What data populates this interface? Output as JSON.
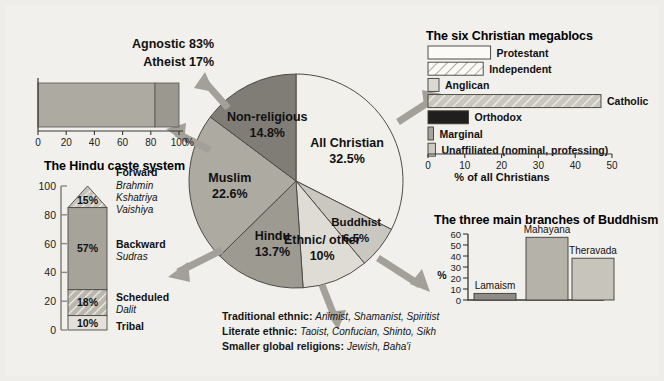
{
  "background_color": "#f1f0ec",
  "chart_data": [
    {
      "type": "pie",
      "name": "world-religions-pie",
      "title": "",
      "categories": [
        "All Christian",
        "Buddhist",
        "Ethnic/other",
        "Hindu",
        "Muslim",
        "Non-religious"
      ],
      "values": [
        32.5,
        6.5,
        10,
        13.7,
        22.6,
        14.8
      ],
      "labels": [
        {
          "name": "All Christian",
          "value": "32.5%"
        },
        {
          "name": "Buddhist",
          "value": "6.5%"
        },
        {
          "name": "Ethnic/ other",
          "value": "10%"
        },
        {
          "name": "Hindu",
          "value": "13.7%"
        },
        {
          "name": "Muslim",
          "value": "22.6%"
        },
        {
          "name": "Non-religious",
          "value": "14.8%"
        }
      ],
      "colors": [
        "#f2f0ea",
        "#c9c7bf",
        "#dedcd4",
        "#9d9a92",
        "#adaaa2",
        "#807d77"
      ],
      "start_angle_deg": 0,
      "direction": "clockwise"
    },
    {
      "type": "bar",
      "name": "agnostic-atheist-bar",
      "orientation": "horizontal",
      "stacked": true,
      "categories": [
        "Agnostic",
        "Atheist"
      ],
      "values": [
        83,
        17
      ],
      "axis_ticks": [
        "0",
        "20",
        "40",
        "60",
        "80",
        "100"
      ],
      "axis_unit": "%",
      "xlim": [
        0,
        100
      ],
      "colors": [
        "#adaaa2",
        "#9b9890"
      ],
      "annotations": [
        "Agnostic 83%",
        "Atheist 17%"
      ]
    },
    {
      "type": "bar",
      "name": "hindu-caste-bar",
      "orientation": "vertical",
      "stacked": true,
      "title": "The Hindu caste system",
      "ylim": [
        0,
        100
      ],
      "axis_ticks": [
        "0",
        "20",
        "40",
        "60",
        "80",
        "100"
      ],
      "segments": [
        {
          "label": "Tribal",
          "sub": "",
          "value": 10,
          "display": "10%",
          "fill": "#e3e1da",
          "pattern": "solid"
        },
        {
          "label": "Scheduled",
          "sub": "Dalit",
          "value": 18,
          "display": "18%",
          "fill": "#c3c0b8",
          "pattern": "hatch"
        },
        {
          "label": "Backward",
          "sub": "Sudras",
          "value": 57,
          "display": "57%",
          "fill": "#a6a39b",
          "pattern": "solid"
        },
        {
          "label": "Forward",
          "sub": "Brahmin Kshatriya Vaishiya",
          "value": 15,
          "display": "15%",
          "fill": "#b0ada5",
          "pattern": "hatch"
        }
      ],
      "forward_sub_lines": [
        "Brahmin",
        "Kshatriya",
        "Vaishiya"
      ]
    },
    {
      "type": "bar",
      "name": "christian-megablocs-bar",
      "orientation": "horizontal",
      "title": "The six Christian megablocs",
      "xlabel": "% of all Christians",
      "xlim": [
        0,
        50
      ],
      "axis_ticks": [
        "0",
        "10",
        "20",
        "30",
        "40",
        "50"
      ],
      "categories": [
        "Protestant",
        "Independent",
        "Anglican",
        "Catholic",
        "Orthodox",
        "Marginal",
        "Unaffiliated (nominal, professing)"
      ],
      "values": [
        17,
        15,
        3,
        47,
        11,
        1.5,
        2
      ],
      "fills": [
        "#fbfaf6",
        "#f6f4ee",
        "#dbd9d2",
        "#b9b6ae",
        "#201f1d",
        "#a7a49c",
        "#cdcac2"
      ],
      "patterns": [
        "solid",
        "hatch",
        "solid",
        "hatch",
        "solid",
        "solid",
        "solid"
      ]
    },
    {
      "type": "bar",
      "name": "buddhism-branches-bar",
      "orientation": "vertical",
      "title": "The three main branches of Buddhism",
      "ylabel": "%",
      "ylim": [
        0,
        60
      ],
      "axis_ticks": [
        "0",
        "10",
        "20",
        "30",
        "40",
        "50",
        "60"
      ],
      "categories": [
        "Lamaism",
        "Mahayana",
        "Theravada"
      ],
      "values": [
        6,
        57,
        38
      ],
      "fills": [
        "#8f8c85",
        "#b5b2aa",
        "#c7c4bc"
      ]
    }
  ],
  "pie": {
    "slices": [
      {
        "name": "All Christian",
        "pct": "32.5%"
      },
      {
        "name": "Buddhist",
        "pct": "6.5%"
      },
      {
        "name": "Ethnic/",
        "name2": "other",
        "pct": "10%"
      },
      {
        "name": "Hindu",
        "pct": "13.7%"
      },
      {
        "name": "Muslim",
        "pct": "22.6%"
      },
      {
        "name": "Non-religious",
        "pct": "14.8%"
      }
    ]
  },
  "agnostic": {
    "line1": "Agnostic 83%",
    "line2": "Atheist 17%",
    "ticks": [
      "0",
      "20",
      "40",
      "60",
      "80",
      "100"
    ],
    "unit": "%"
  },
  "caste": {
    "title": "The Hindu caste system",
    "ticks": [
      "100",
      "80",
      "60",
      "40",
      "20",
      "0"
    ],
    "v_forward": "15%",
    "v_backward": "57%",
    "v_scheduled": "18%",
    "v_tribal": "10%",
    "l_forward": "Forward",
    "l_forward_1": "Brahmin",
    "l_forward_2": "Kshatriya",
    "l_forward_3": "Vaishiya",
    "l_backward": "Backward",
    "l_backward_sub": "Sudras",
    "l_scheduled": "Scheduled",
    "l_scheduled_sub": "Dalit",
    "l_tribal": "Tribal"
  },
  "mega": {
    "title": "The six Christian megablocs",
    "caption": "% of all Christians",
    "ticks": [
      "0",
      "10",
      "20",
      "30",
      "40",
      "50"
    ],
    "rows": [
      {
        "label": "Protestant"
      },
      {
        "label": "Independent"
      },
      {
        "label": "Anglican"
      },
      {
        "label": "Catholic"
      },
      {
        "label": "Orthodox"
      },
      {
        "label": "Marginal"
      },
      {
        "label": "Unaffiliated (nominal, professing)"
      }
    ]
  },
  "buddhism": {
    "title": "The three main branches of Buddhism",
    "ylabel": "%",
    "ticks": [
      "60",
      "50",
      "40",
      "30",
      "20",
      "10",
      "0"
    ],
    "bars": [
      {
        "label": "Lamaism"
      },
      {
        "label": "Mahayana"
      },
      {
        "label": "Theravada"
      }
    ]
  },
  "notes": {
    "row1_label": "Traditional ethnic:",
    "row1_value": "Animist, Shamanist, Spiritist",
    "row2_label": "Literate ethnic:",
    "row2_value": "Taoist, Confucian, Shinto, Sikh",
    "row3_label": "Smaller global religions:",
    "row3_value": "Jewish, Baha'i"
  }
}
